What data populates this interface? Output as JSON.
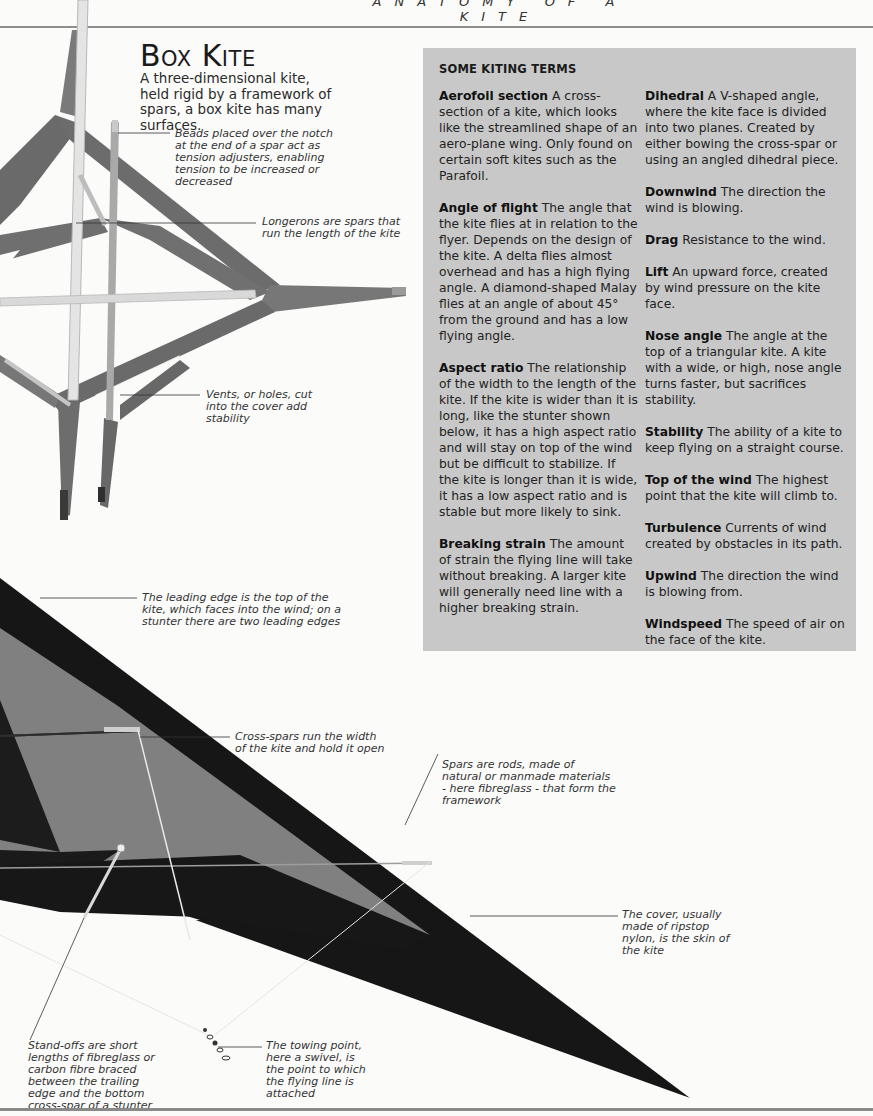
{
  "page": {
    "running_head": "ANATOMY OF A KITE",
    "title": "Box Kite",
    "subtitle": "A three-dimensional kite, held rigid by a framework of spars, a box kite has many surfaces."
  },
  "box_kite_callouts": [
    {
      "id": "beads",
      "text": "Beads placed over the notch at the end of a spar act as tension adjusters, enabling tension to be increased or decreased"
    },
    {
      "id": "longerons",
      "text": "Longerons are spars that run the length of the kite"
    },
    {
      "id": "vents",
      "text": "Vents, or holes, cut into the cover add stability"
    }
  ],
  "stunter_callouts": [
    {
      "id": "leading-edge",
      "text": "The leading edge is the top of the kite, which faces into the wind; on a stunter there are two leading edges"
    },
    {
      "id": "cross-spars",
      "text": "Cross-spars run the width of the kite and hold it open"
    },
    {
      "id": "spars",
      "text": "Spars are rods, made of natural or manmade materials - here fibreglass - that form the framework"
    },
    {
      "id": "cover",
      "text": "The cover, usually made of ripstop nylon, is the skin of the kite"
    },
    {
      "id": "stand-offs",
      "text": "Stand-offs are short lengths of fibreglass or carbon fibre braced between the trailing edge and the bottom cross-spar of a stunter"
    },
    {
      "id": "towing-point",
      "text": "The towing point, here a swivel, is the point to which the flying line is attached"
    }
  ],
  "terms_box": {
    "heading": "SOME KITING TERMS",
    "left_column": [
      {
        "term": "Aerofoil section",
        "definition": "A cross-section of a kite, which looks like the streamlined shape of an aero-plane wing. Only found on certain soft kites such as the Parafoil."
      },
      {
        "term": "Angle of flight",
        "definition": "The angle that the kite flies at in relation to the flyer. Depends on the design of the kite. A delta flies almost overhead and has a high flying angle. A diamond-shaped Malay flies at an angle of about 45° from the ground and has a low flying angle."
      },
      {
        "term": "Aspect ratio",
        "definition": "The relationship of the width to the length of the kite. If the kite is wider than it is long, like the stunter shown below, it has a high aspect ratio and will stay on top of the wind but be difficult to stabilize. If the kite is longer than it is wide, it has a low aspect ratio and is stable but more likely to sink."
      },
      {
        "term": "Breaking strain",
        "definition": "The amount of strain the flying line will take without breaking. A larger kite will generally need line with a higher breaking strain."
      }
    ],
    "right_column": [
      {
        "term": "Dihedral",
        "definition": "A V-shaped angle, where the kite face is divided into two planes. Created by either bowing the cross-spar or using an angled dihedral piece."
      },
      {
        "term": "Downwind",
        "definition": "The direction the wind is blowing."
      },
      {
        "term": "Drag",
        "definition": "Resistance to the wind."
      },
      {
        "term": "Lift",
        "definition": "An upward force, created by wind pressure on the kite face."
      },
      {
        "term": "Nose angle",
        "definition": "The angle at the top of a triangular kite. A kite with a wide, or high, nose angle turns faster, but sacrifices stability."
      },
      {
        "term": "Stability",
        "definition": "The ability of a kite to keep flying on a straight course."
      },
      {
        "term": "Top of the wind",
        "definition": "The highest point that the kite will climb to."
      },
      {
        "term": "Turbulence",
        "definition": "Currents of wind created by obstacles in its path."
      },
      {
        "term": "Upwind",
        "definition": "The direction the wind is blowing from."
      },
      {
        "term": "Windspeed",
        "definition": "The speed of air on the face of the kite."
      }
    ]
  },
  "colors": {
    "page_bg": "#fbfbfa",
    "terms_box_bg": "#c8c8c8",
    "box_kite_fabric": "#6e6e6e",
    "stunter_dark": "#141414",
    "stunter_panel": "#7d7d7d",
    "rule": "#8f8f8f"
  }
}
